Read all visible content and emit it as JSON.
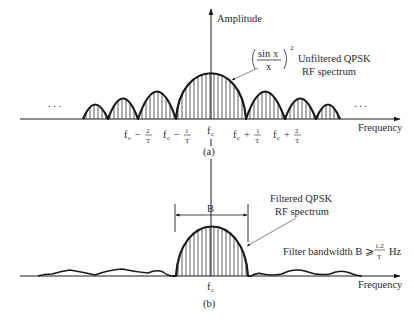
{
  "panel_a": {
    "y_axis_label": "Amplitude",
    "x_axis_label": "Frequency",
    "formula_num": "sin x",
    "formula_den": "x",
    "formula_exp": "2",
    "annotation_line1": "Unfiltered QPSK",
    "annotation_line2": "RF spectrum",
    "ellipsis_left": ". . .",
    "ellipsis_right": ". . .",
    "ticks": [
      {
        "base": "f",
        "sub": "c",
        "op": "−",
        "num": "2",
        "den": "T"
      },
      {
        "base": "f",
        "sub": "c",
        "op": "−",
        "num": "1",
        "den": "T"
      },
      {
        "base": "f",
        "sub": "c",
        "op": "",
        "num": "",
        "den": ""
      },
      {
        "base": "f",
        "sub": "c",
        "op": "+",
        "num": "1",
        "den": "T"
      },
      {
        "base": "f",
        "sub": "c",
        "op": "+",
        "num": "2",
        "den": "T"
      }
    ],
    "caption": "(a)"
  },
  "panel_b": {
    "x_axis_label": "Frequency",
    "bandwidth_label": "B",
    "annotation_line1": "Filtered QPSK",
    "annotation_line2": "RF spectrum",
    "filter_text": "Filter bandwidth B ⩾",
    "filter_num": "1.2",
    "filter_den": "T",
    "filter_unit": "Hz",
    "center_tick_base": "f",
    "center_tick_sub": "c",
    "caption": "(b)"
  },
  "colors": {
    "ink": "#1a1a1a",
    "text": "#2a2a2a",
    "background": "#ffffff"
  }
}
